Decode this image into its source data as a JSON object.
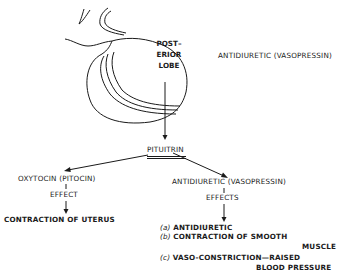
{
  "gland": {
    "lobe_label_lines": [
      "POST–",
      "ERIOR",
      "LOBE"
    ]
  },
  "side_label": "ANTIDIURETIC (VASOPRESSIN)",
  "hormone": "PITUITRIN",
  "branches": {
    "left": {
      "name": "OXYTOCIN (PITOCIN)",
      "connector": "EFFECT",
      "result": "CONTRACTION OF UTERUS"
    },
    "right": {
      "name": "ANTIDIURETIC (VASOPRESSIN)",
      "connector": "EFFECTS",
      "effects": [
        {
          "marker": "(a)",
          "text": "ANTIDIURETIC"
        },
        {
          "marker": "(b)",
          "text": "CONTRACTION OF SMOOTH",
          "continuation": "MUSCLE"
        },
        {
          "marker": "(c)",
          "text": "VASO-CONSTRICTION—RAISED",
          "continuation": "BLOOD PRESSURE"
        }
      ]
    }
  },
  "colors": {
    "ink": "#1a1a1a",
    "background": "#ffffff"
  }
}
